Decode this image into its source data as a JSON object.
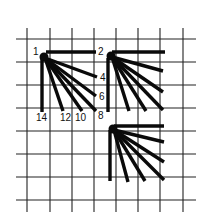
{
  "diagram": {
    "colors": {
      "background": "#ffffff",
      "grid": "#222222",
      "stitch": "#0a0a0a",
      "label": "#111111"
    },
    "grid": {
      "vertical_x": [
        27,
        50,
        72,
        94,
        116,
        138,
        160,
        183
      ],
      "horizontal_y": [
        39,
        62,
        85,
        108,
        131,
        154,
        177,
        200
      ],
      "x_extent": [
        16,
        196
      ],
      "y_extent": [
        28,
        212
      ]
    },
    "fans": [
      {
        "name": "fan-1",
        "hub": [
          45,
          58
        ],
        "horizontal": [
          [
            46,
            52
          ],
          [
            96,
            52
          ]
        ],
        "vertical": [
          [
            42,
            58
          ],
          [
            42,
            112
          ]
        ],
        "rays": [
          [
            97,
            77
          ],
          [
            96,
            96
          ],
          [
            96,
            111
          ],
          [
            82,
            111
          ],
          [
            63,
            111
          ]
        ]
      },
      {
        "name": "fan-2",
        "hub": [
          112,
          57
        ],
        "horizontal": [
          [
            112,
            52
          ],
          [
            165,
            52
          ]
        ],
        "vertical": [
          [
            108,
            58
          ],
          [
            108,
            112
          ]
        ],
        "rays": [
          [
            163,
            71
          ],
          [
            163,
            92
          ],
          [
            163,
            110
          ],
          [
            146,
            111
          ],
          [
            129,
            111
          ]
        ]
      },
      {
        "name": "fan-3",
        "hub": [
          114,
          130
        ],
        "horizontal": [
          [
            114,
            126
          ],
          [
            164,
            126
          ]
        ],
        "vertical": [
          [
            110,
            130
          ],
          [
            110,
            181
          ]
        ],
        "rays": [
          [
            164,
            142
          ],
          [
            164,
            162
          ],
          [
            164,
            180
          ],
          [
            145,
            181
          ],
          [
            128,
            182
          ]
        ]
      }
    ],
    "labels": [
      {
        "text": "1",
        "x": 33,
        "y": 55
      },
      {
        "text": "2",
        "x": 98,
        "y": 55
      },
      {
        "text": "4",
        "x": 100,
        "y": 81
      },
      {
        "text": "6",
        "x": 99,
        "y": 100
      },
      {
        "text": "8",
        "x": 98,
        "y": 119
      },
      {
        "text": "10",
        "x": 75,
        "y": 121
      },
      {
        "text": "12",
        "x": 60,
        "y": 121
      },
      {
        "text": "14",
        "x": 36,
        "y": 121
      }
    ]
  }
}
